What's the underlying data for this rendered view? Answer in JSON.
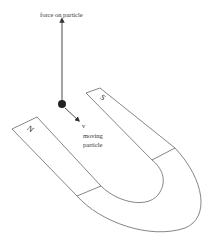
{
  "diagram": {
    "labels": {
      "force": "force on particle",
      "velocity": "v",
      "moving_line1": "moving",
      "moving_line2": "particle",
      "north_pole": "N",
      "south_pole": "S"
    },
    "colors": {
      "stroke": "#555555",
      "particle": "#222222",
      "text": "#333333",
      "background": "#ffffff"
    }
  }
}
